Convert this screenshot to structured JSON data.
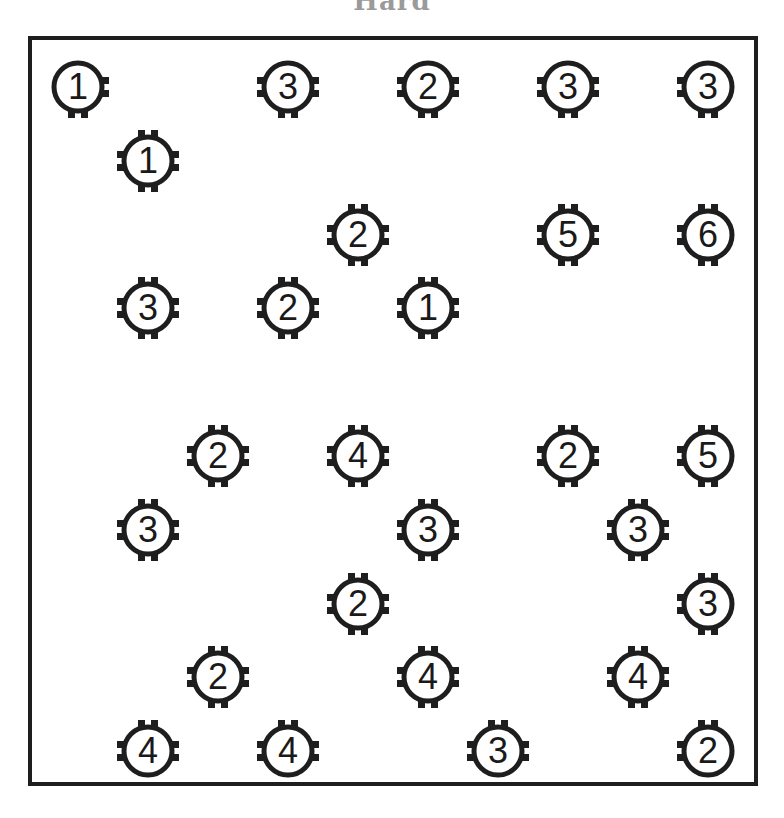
{
  "title": "Hard",
  "puzzle": {
    "type": "hashi-bridges",
    "grid_cols": 10,
    "grid_rows": 10,
    "pitch_x": 70,
    "pitch_y": 73.8,
    "origin_x": 78,
    "origin_y": 87,
    "colors": {
      "ink": "#1e1e1e",
      "background": "#ffffff",
      "title": "#9a9a9a"
    },
    "nodes": [
      {
        "col": 0,
        "row": 0,
        "value": "1",
        "tabs": [
          "r",
          "b"
        ]
      },
      {
        "col": 3,
        "row": 0,
        "value": "3",
        "tabs": [
          "l",
          "r",
          "b"
        ]
      },
      {
        "col": 5,
        "row": 0,
        "value": "2",
        "tabs": [
          "l",
          "r",
          "b"
        ]
      },
      {
        "col": 7,
        "row": 0,
        "value": "3",
        "tabs": [
          "l",
          "r",
          "b"
        ]
      },
      {
        "col": 9,
        "row": 0,
        "value": "3",
        "tabs": [
          "l",
          "b"
        ]
      },
      {
        "col": 1,
        "row": 1,
        "value": "1",
        "tabs": [
          "t",
          "l",
          "r",
          "b"
        ]
      },
      {
        "col": 4,
        "row": 2,
        "value": "2",
        "tabs": [
          "t",
          "l",
          "r",
          "b"
        ]
      },
      {
        "col": 7,
        "row": 2,
        "value": "5",
        "tabs": [
          "t",
          "l",
          "r",
          "b"
        ]
      },
      {
        "col": 9,
        "row": 2,
        "value": "6",
        "tabs": [
          "t",
          "l",
          "b"
        ]
      },
      {
        "col": 1,
        "row": 3,
        "value": "3",
        "tabs": [
          "t",
          "l",
          "r",
          "b"
        ]
      },
      {
        "col": 3,
        "row": 3,
        "value": "2",
        "tabs": [
          "t",
          "l",
          "r",
          "b"
        ]
      },
      {
        "col": 5,
        "row": 3,
        "value": "1",
        "tabs": [
          "t",
          "l",
          "r",
          "b"
        ]
      },
      {
        "col": 2,
        "row": 5,
        "value": "2",
        "tabs": [
          "t",
          "l",
          "r",
          "b"
        ]
      },
      {
        "col": 4,
        "row": 5,
        "value": "4",
        "tabs": [
          "t",
          "l",
          "r",
          "b"
        ]
      },
      {
        "col": 7,
        "row": 5,
        "value": "2",
        "tabs": [
          "t",
          "l",
          "r",
          "b"
        ]
      },
      {
        "col": 9,
        "row": 5,
        "value": "5",
        "tabs": [
          "t",
          "l",
          "b"
        ]
      },
      {
        "col": 1,
        "row": 6,
        "value": "3",
        "tabs": [
          "t",
          "l",
          "r",
          "b"
        ]
      },
      {
        "col": 5,
        "row": 6,
        "value": "3",
        "tabs": [
          "t",
          "l",
          "r",
          "b"
        ]
      },
      {
        "col": 8,
        "row": 6,
        "value": "3",
        "tabs": [
          "t",
          "l",
          "r",
          "b"
        ]
      },
      {
        "col": 4,
        "row": 7,
        "value": "2",
        "tabs": [
          "t",
          "l",
          "r",
          "b"
        ]
      },
      {
        "col": 9,
        "row": 7,
        "value": "3",
        "tabs": [
          "t",
          "l",
          "b"
        ]
      },
      {
        "col": 2,
        "row": 8,
        "value": "2",
        "tabs": [
          "t",
          "l",
          "r",
          "b"
        ]
      },
      {
        "col": 5,
        "row": 8,
        "value": "4",
        "tabs": [
          "t",
          "l",
          "r",
          "b"
        ]
      },
      {
        "col": 8,
        "row": 8,
        "value": "4",
        "tabs": [
          "t",
          "l",
          "r",
          "b"
        ]
      },
      {
        "col": 1,
        "row": 9,
        "value": "4",
        "tabs": [
          "t",
          "l",
          "r"
        ]
      },
      {
        "col": 3,
        "row": 9,
        "value": "4",
        "tabs": [
          "t",
          "l",
          "r"
        ]
      },
      {
        "col": 6,
        "row": 9,
        "value": "3",
        "tabs": [
          "t",
          "l",
          "r"
        ]
      },
      {
        "col": 9,
        "row": 9,
        "value": "2",
        "tabs": [
          "t",
          "l"
        ]
      }
    ]
  }
}
